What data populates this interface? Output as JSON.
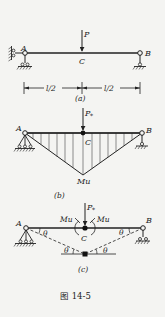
{
  "figure": {
    "caption": "图 14-5",
    "panels": [
      {
        "id": "a",
        "tag": "(a)",
        "labels": {
          "left_support": "A",
          "right_support": "B",
          "midpoint": "C",
          "load": "P"
        },
        "dimensions": [
          "l/2",
          "l/2"
        ]
      },
      {
        "id": "b",
        "tag": "(b)",
        "labels": {
          "left_support": "A",
          "right_support": "B",
          "midpoint": "C",
          "load": "P",
          "load_sub": "*",
          "moment": "Mu"
        }
      },
      {
        "id": "c",
        "tag": "(c)",
        "labels": {
          "left_support": "A",
          "right_support": "B",
          "midpoint": "C",
          "load": "P",
          "load_sub": "*",
          "moment_left": "Mu",
          "moment_right": "Mu",
          "angle": "θ"
        }
      }
    ]
  },
  "colors": {
    "ink": "#222222",
    "background": "#f4f4f2"
  }
}
